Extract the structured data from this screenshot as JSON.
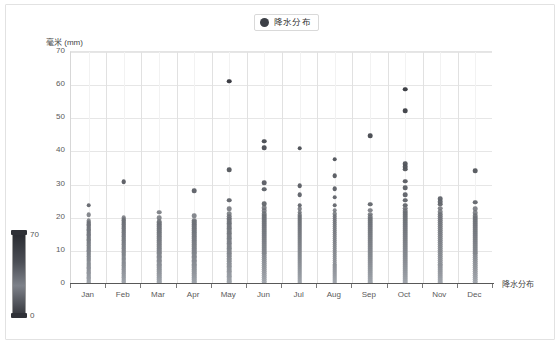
{
  "legend": {
    "label": "降水分布",
    "marker_color": "#3c3f46"
  },
  "axes": {
    "y_title": "毫米 (mm)",
    "x_title": "降水分布",
    "y_ticks": [
      "0",
      "10",
      "20",
      "30",
      "40",
      "50",
      "60",
      "70"
    ],
    "x_ticks": [
      "Jan",
      "Feb",
      "Mar",
      "Apr",
      "May",
      "Jun",
      "Jul",
      "Aug",
      "Sep",
      "Oct",
      "Nov",
      "Dec"
    ]
  },
  "visual_map": {
    "max_label": "70",
    "min_label": "0",
    "color_high": "#2b2d33",
    "color_low": "#9aa0a8"
  },
  "chart_data": {
    "type": "scatter",
    "title": "",
    "subtitle": "",
    "xlabel": "降水分布",
    "ylabel": "毫米 (mm)",
    "legend": [
      "降水分布"
    ],
    "legend_position": "top-center",
    "grid": true,
    "ylim": [
      0,
      70
    ],
    "ytick_values": [
      0,
      10,
      20,
      30,
      40,
      50,
      60,
      70
    ],
    "categories": [
      "Jan",
      "Feb",
      "Mar",
      "Apr",
      "May",
      "Jun",
      "Jul",
      "Aug",
      "Sep",
      "Oct",
      "Nov",
      "Dec"
    ],
    "color_maps_to": "y-value",
    "series": [
      {
        "name": "降水分布",
        "points": {
          "Jan": [
            24.1,
            21.2,
            19.4,
            19.0,
            18.6,
            18.2,
            17.9,
            17.5,
            17.1,
            16.8,
            16.4,
            16.0,
            15.6,
            15.2,
            14.9,
            14.5,
            14.1,
            13.8,
            13.4,
            13.0,
            12.7,
            12.3,
            11.9,
            11.5,
            11.2,
            10.8,
            10.4,
            10.1,
            9.7,
            9.3,
            8.9,
            8.6,
            8.2,
            7.8,
            7.5,
            7.1,
            6.7,
            6.3,
            6.0,
            5.6,
            5.2,
            4.9,
            4.5,
            4.1,
            3.7,
            3.4,
            3.0,
            2.6,
            2.3,
            1.9,
            1.5,
            1.1,
            0.8,
            0.4,
            0.2
          ],
          "Feb": [
            31.3,
            20.3,
            19.8,
            19.4,
            19.0,
            18.6,
            18.2,
            17.8,
            17.4,
            17.0,
            16.6,
            16.2,
            15.8,
            15.4,
            15.0,
            14.6,
            14.2,
            13.8,
            13.4,
            13.0,
            12.6,
            12.2,
            11.8,
            11.4,
            11.0,
            10.6,
            10.2,
            9.8,
            9.4,
            9.0,
            8.6,
            8.2,
            7.8,
            7.4,
            7.0,
            6.6,
            6.2,
            5.8,
            5.4,
            5.0,
            4.6,
            4.2,
            3.8,
            3.4,
            3.0,
            2.6,
            2.2,
            1.8,
            1.4,
            1.0,
            0.6,
            0.3
          ],
          "Mar": [
            22.0,
            20.4,
            19.2,
            18.8,
            18.4,
            18.0,
            17.6,
            17.2,
            16.8,
            16.4,
            16.0,
            15.6,
            15.2,
            14.8,
            14.4,
            14.0,
            13.6,
            13.2,
            12.8,
            12.4,
            12.0,
            11.6,
            11.2,
            10.8,
            10.4,
            10.0,
            9.6,
            9.2,
            8.8,
            8.4,
            8.0,
            7.6,
            7.2,
            6.8,
            6.4,
            6.0,
            5.6,
            5.2,
            4.8,
            4.4,
            4.0,
            3.6,
            3.2,
            2.8,
            2.4,
            2.0,
            1.6,
            1.2,
            0.8,
            0.4
          ],
          "Apr": [
            28.6,
            20.9,
            19.6,
            19.2,
            18.8,
            18.4,
            18.0,
            17.6,
            17.2,
            16.8,
            16.4,
            16.0,
            15.6,
            15.2,
            14.8,
            14.4,
            14.0,
            13.6,
            13.2,
            12.8,
            12.4,
            12.0,
            11.6,
            11.2,
            10.8,
            10.4,
            10.0,
            9.6,
            9.2,
            8.8,
            8.4,
            8.0,
            7.6,
            7.2,
            6.8,
            6.4,
            6.0,
            5.6,
            5.2,
            4.8,
            4.4,
            4.0,
            3.6,
            3.2,
            2.8,
            2.4,
            2.0,
            1.6,
            1.2,
            0.8,
            0.4
          ],
          "May": [
            61.6,
            34.9,
            25.6,
            23.0,
            21.6,
            20.8,
            20.2,
            19.7,
            19.2,
            18.7,
            18.2,
            17.7,
            17.2,
            16.7,
            16.2,
            15.7,
            15.2,
            14.7,
            14.2,
            13.7,
            13.2,
            12.7,
            12.2,
            11.7,
            11.2,
            10.7,
            10.2,
            9.7,
            9.2,
            8.7,
            8.2,
            7.7,
            7.2,
            6.7,
            6.2,
            5.7,
            5.2,
            4.7,
            4.2,
            3.7,
            3.2,
            2.7,
            2.2,
            1.7,
            1.2,
            0.7,
            0.3
          ],
          "Jun": [
            43.4,
            41.5,
            31.0,
            29.0,
            24.6,
            23.4,
            22.4,
            21.6,
            21.0,
            20.4,
            19.8,
            19.2,
            18.6,
            18.0,
            17.4,
            16.8,
            16.2,
            15.6,
            15.0,
            14.4,
            13.8,
            13.2,
            12.6,
            12.0,
            11.4,
            10.8,
            10.2,
            9.6,
            9.0,
            8.4,
            7.8,
            7.2,
            6.6,
            6.0,
            5.4,
            4.8,
            4.2,
            3.6,
            3.0,
            2.4,
            1.8,
            1.2,
            0.6,
            0.3
          ],
          "Jul": [
            41.3,
            30.1,
            27.3,
            24.2,
            23.0,
            22.0,
            21.2,
            20.6,
            20.0,
            19.4,
            18.8,
            18.2,
            17.6,
            17.0,
            16.4,
            15.8,
            15.2,
            14.6,
            14.0,
            13.4,
            12.8,
            12.2,
            11.6,
            11.0,
            10.4,
            9.8,
            9.2,
            8.6,
            8.0,
            7.4,
            6.8,
            6.2,
            5.6,
            5.0,
            4.4,
            3.8,
            3.2,
            2.6,
            2.0,
            1.4,
            0.8,
            0.4
          ],
          "Aug": [
            38.0,
            33.0,
            29.2,
            26.6,
            24.2,
            22.6,
            21.6,
            20.8,
            20.2,
            19.6,
            19.0,
            18.4,
            17.8,
            17.2,
            16.6,
            16.0,
            15.4,
            14.8,
            14.2,
            13.6,
            13.0,
            12.4,
            11.8,
            11.2,
            10.6,
            10.0,
            9.4,
            8.8,
            8.2,
            7.6,
            7.0,
            6.4,
            5.8,
            5.2,
            4.6,
            4.0,
            3.4,
            2.8,
            2.2,
            1.6,
            1.0,
            0.5
          ],
          "Sep": [
            45.2,
            24.5,
            22.6,
            21.4,
            20.6,
            20.0,
            19.4,
            18.8,
            18.2,
            17.6,
            17.0,
            16.4,
            15.8,
            15.2,
            14.6,
            14.0,
            13.4,
            12.8,
            12.2,
            11.6,
            11.0,
            10.4,
            9.8,
            9.2,
            8.6,
            8.0,
            7.4,
            6.8,
            6.2,
            5.6,
            5.0,
            4.4,
            3.8,
            3.2,
            2.6,
            2.0,
            1.4,
            0.8,
            0.4
          ],
          "Oct": [
            59.2,
            52.7,
            36.6,
            35.8,
            35.0,
            31.4,
            29.4,
            27.4,
            25.6,
            24.2,
            23.2,
            22.4,
            21.8,
            21.2,
            20.6,
            20.0,
            19.4,
            18.8,
            18.2,
            17.6,
            17.0,
            16.4,
            15.8,
            15.2,
            14.6,
            14.0,
            13.4,
            12.8,
            12.2,
            11.6,
            11.0,
            10.4,
            9.8,
            9.2,
            8.6,
            8.0,
            7.4,
            6.8,
            6.2,
            5.6,
            5.0,
            4.4,
            3.8,
            3.2,
            2.6,
            2.0,
            1.4,
            0.8,
            0.3
          ],
          "Nov": [
            26.1,
            25.2,
            24.4,
            23.2,
            22.2,
            21.4,
            20.8,
            20.2,
            19.6,
            19.0,
            18.4,
            17.8,
            17.2,
            16.6,
            16.0,
            15.4,
            14.8,
            14.2,
            13.6,
            13.0,
            12.4,
            11.8,
            11.2,
            10.6,
            10.0,
            9.4,
            8.8,
            8.2,
            7.6,
            7.0,
            6.4,
            5.8,
            5.2,
            4.6,
            4.0,
            3.4,
            2.8,
            2.2,
            1.6,
            1.0,
            0.5
          ],
          "Dec": [
            34.6,
            25.0,
            23.0,
            21.8,
            21.0,
            20.4,
            19.8,
            19.2,
            18.6,
            18.0,
            17.4,
            16.8,
            16.2,
            15.6,
            15.0,
            14.4,
            13.8,
            13.2,
            12.6,
            12.0,
            11.4,
            10.8,
            10.2,
            9.6,
            9.0,
            8.4,
            7.8,
            7.2,
            6.6,
            6.0,
            5.4,
            4.8,
            4.2,
            3.6,
            3.0,
            2.4,
            1.8,
            1.2,
            0.6,
            0.3
          ]
        }
      }
    ]
  }
}
